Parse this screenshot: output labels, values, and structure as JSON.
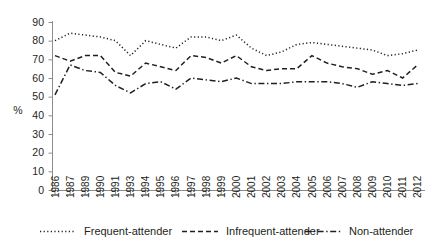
{
  "chart_data": {
    "type": "line",
    "title": "",
    "xlabel": "",
    "ylabel": "%",
    "ylim": [
      0,
      90
    ],
    "ytick_step": 10,
    "grid": false,
    "legend_position": "bottom",
    "categories": [
      "1986",
      "1987",
      "1989",
      "1990",
      "1991",
      "1993",
      "1994",
      "1995",
      "1996",
      "1997",
      "1998",
      "1999",
      "2000",
      "2001",
      "2002",
      "2003",
      "2004",
      "2005",
      "2006",
      "2007",
      "2008",
      "2009",
      "2010",
      "2011",
      "2012"
    ],
    "yticks": [
      "0",
      "10",
      "20",
      "30",
      "40",
      "50",
      "60",
      "70",
      "80",
      "90"
    ],
    "series": [
      {
        "name": "Frequent-attender",
        "style": "dotted",
        "values": [
          80,
          84,
          83,
          82,
          80,
          72,
          80,
          78,
          76,
          82,
          82,
          80,
          83,
          76,
          72,
          74,
          78,
          79,
          78,
          77,
          76,
          75,
          72,
          73,
          75
        ]
      },
      {
        "name": "Infrequent-attender",
        "style": "dashed",
        "values": [
          72,
          69,
          72,
          72,
          63,
          61,
          68,
          66,
          64,
          72,
          71,
          68,
          72,
          66,
          64,
          65,
          65,
          72,
          68,
          66,
          65,
          62,
          64,
          60,
          67
        ]
      },
      {
        "name": "Non-attender",
        "style": "dash-dot",
        "values": [
          51,
          67,
          64,
          63,
          56,
          52,
          57,
          58,
          54,
          60,
          59,
          58,
          60,
          57,
          57,
          57,
          58,
          58,
          58,
          57,
          55,
          58,
          57,
          56,
          57
        ]
      }
    ]
  },
  "legend": {
    "items": [
      {
        "label": "Frequent-attender",
        "style": "dotted"
      },
      {
        "label": "Infrequent-attender",
        "style": "dashed"
      },
      {
        "label": "Non-attender",
        "style": "dash-dot"
      }
    ]
  },
  "colors": {
    "ink": "#231f20",
    "axis": "#8d8d8d",
    "background": "#ffffff"
  }
}
